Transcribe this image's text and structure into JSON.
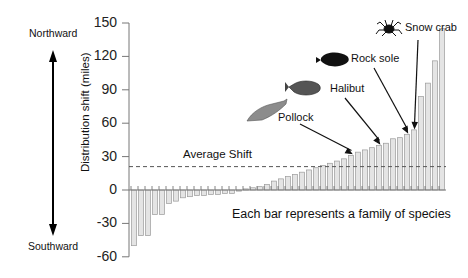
{
  "chart_data": {
    "type": "bar",
    "title": "",
    "xlabel": "",
    "ylabel": "Distribution shift (miles)",
    "ylim": [
      -60,
      150
    ],
    "yticks": [
      150,
      120,
      90,
      60,
      30,
      0,
      -30,
      -60
    ],
    "grid": false,
    "legend": null,
    "categories_note": "Each bar represents a family of species",
    "values": [
      -50,
      -41,
      -41,
      -22,
      -22,
      -12,
      -10,
      -7,
      -6,
      -5,
      -5,
      -4,
      -4,
      -3,
      -3,
      -1,
      1,
      2,
      3,
      5,
      8,
      10,
      12,
      14,
      16,
      18,
      20,
      22,
      24,
      26,
      28,
      31,
      34,
      36,
      38,
      40,
      42,
      46,
      47,
      50,
      54,
      84,
      96,
      116,
      145
    ],
    "average_shift": 21,
    "annotations": [
      {
        "label": "Pollock",
        "bar_index": 31
      },
      {
        "label": "Halibut",
        "bar_index": 35
      },
      {
        "label": "Rock sole",
        "bar_index": 39
      },
      {
        "label": "Snow crab",
        "bar_index": 40
      }
    ]
  },
  "labels": {
    "northward": "Northward",
    "southward": "Southward",
    "ylabel": "Distribution shift (miles)",
    "average": "Average Shift",
    "note": "Each bar represents a family of species",
    "pollock": "Pollock",
    "halibut": "Halibut",
    "rock_sole": "Rock sole",
    "snow_crab": "Snow crab"
  },
  "ticks": [
    "150",
    "120",
    "90",
    "60",
    "30",
    "0",
    "-30",
    "-60"
  ],
  "colors": {
    "bar_fill": "#e4e4e4",
    "bar_stroke": "#9a9a9a",
    "axis": "#777777",
    "text": "#111111"
  }
}
